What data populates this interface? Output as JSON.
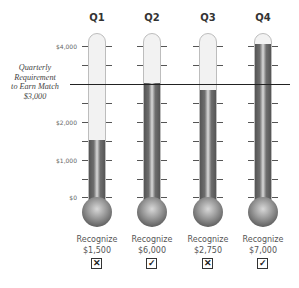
{
  "chart_data": {
    "type": "bar",
    "subtype": "thermometer",
    "title": "",
    "categories": [
      "Q1",
      "Q2",
      "Q3",
      "Q4"
    ],
    "values": [
      1500,
      6000,
      2750,
      7000
    ],
    "ylabel": "",
    "xlabel": "",
    "ylim": [
      0,
      4000
    ],
    "yticks": [
      "$0",
      "$1,000",
      "$2,000",
      "$4,000"
    ],
    "reference_line": {
      "value": 3000,
      "label": "Quarterly Requirement to Earn Match $3,000"
    },
    "met_requirement": [
      false,
      true,
      false,
      true
    ],
    "grid": false,
    "legend": "none"
  },
  "quarters": [
    {
      "label": "Q1",
      "caption": "Recognize",
      "amount": "$1,500",
      "status": "✕"
    },
    {
      "label": "Q2",
      "caption": "Recognize",
      "amount": "$6,000",
      "status": "✓"
    },
    {
      "label": "Q3",
      "caption": "Recognize",
      "amount": "$2,750",
      "status": "✕"
    },
    {
      "label": "Q4",
      "caption": "Recognize",
      "amount": "$7,000",
      "status": "✓"
    }
  ],
  "axis": {
    "t4000": "$4,000",
    "t2000": "$2,000",
    "t1000": "$1,000",
    "t0": "$0"
  },
  "requirement": {
    "line1": "Quarterly",
    "line2": "Requirement",
    "line3": "to Earn Match",
    "line4": "$3,000"
  }
}
